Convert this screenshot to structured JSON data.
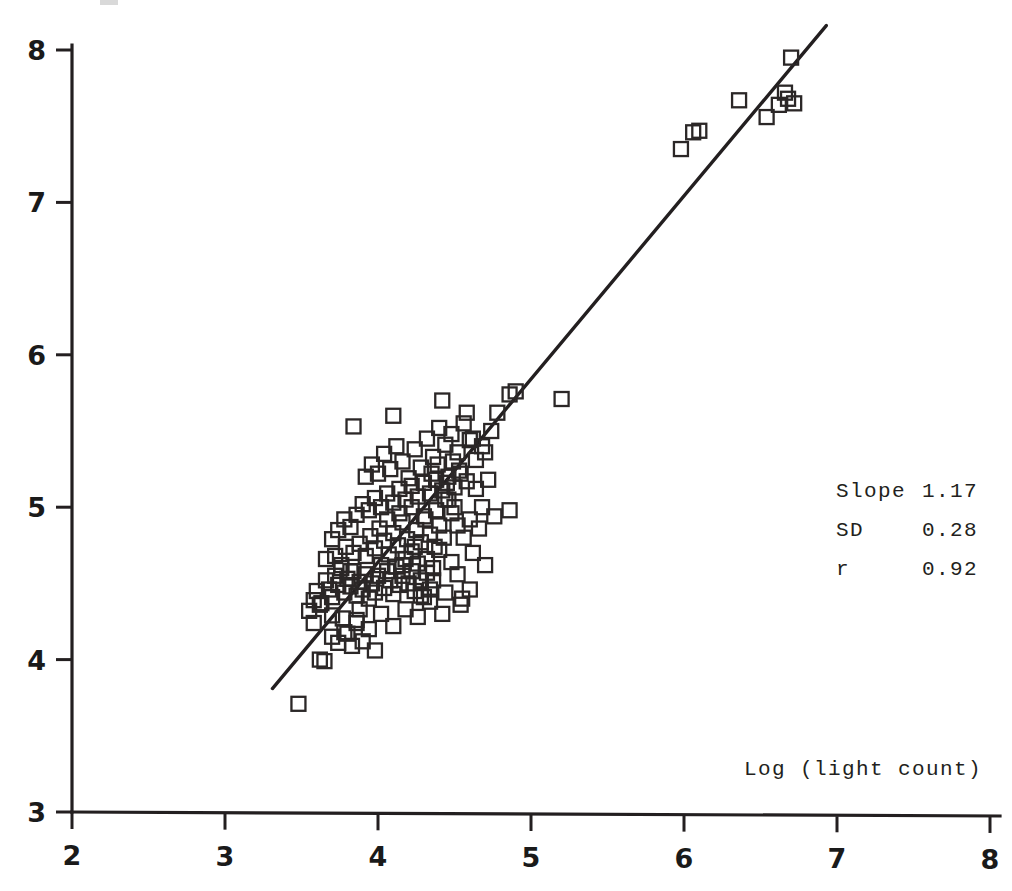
{
  "chart_data": {
    "type": "scatter",
    "title": "",
    "xlabel": "Log (light count)",
    "ylabel": "",
    "xlim": [
      2,
      8
    ],
    "ylim": [
      3,
      8
    ],
    "xticks": [
      2,
      3,
      4,
      5,
      6,
      7,
      8
    ],
    "yticks": [
      3,
      4,
      5,
      6,
      7,
      8
    ],
    "xtick_labels": [
      "2",
      "3",
      "4",
      "5",
      "6",
      "7",
      "8"
    ],
    "ytick_labels": [
      "3",
      "4",
      "5",
      "6",
      "7",
      "8"
    ],
    "grid": false,
    "legend": "none",
    "marker": "open-square",
    "marker_color": "#2b2727",
    "line_color": "#231f20",
    "fit_line": {
      "type": "linear-regression",
      "x_start": 3.31,
      "y_start": 3.81,
      "x_end": 6.93,
      "y_end": 8.16
    },
    "annotations": {
      "slope_label": "Slope",
      "slope_value": "1.17",
      "sd_label": "SD",
      "sd_value": "0.28",
      "r_label": "r",
      "r_value": "0.92"
    },
    "points": [
      [
        3.48,
        3.71
      ],
      [
        3.62,
        4.0
      ],
      [
        3.65,
        3.99
      ],
      [
        3.7,
        4.15
      ],
      [
        3.74,
        4.11
      ],
      [
        3.77,
        4.27
      ],
      [
        3.8,
        4.17
      ],
      [
        3.83,
        4.09
      ],
      [
        3.86,
        4.24
      ],
      [
        3.88,
        4.33
      ],
      [
        3.55,
        4.32
      ],
      [
        3.58,
        4.39
      ],
      [
        3.6,
        4.45
      ],
      [
        3.63,
        4.37
      ],
      [
        3.66,
        4.52
      ],
      [
        3.68,
        4.46
      ],
      [
        3.7,
        4.41
      ],
      [
        3.72,
        4.55
      ],
      [
        3.74,
        4.49
      ],
      [
        3.76,
        4.6
      ],
      [
        3.78,
        4.44
      ],
      [
        3.8,
        4.53
      ],
      [
        3.82,
        4.48
      ],
      [
        3.84,
        4.58
      ],
      [
        3.86,
        4.42
      ],
      [
        3.88,
        4.51
      ],
      [
        3.9,
        4.46
      ],
      [
        3.92,
        4.56
      ],
      [
        3.94,
        4.4
      ],
      [
        3.96,
        4.5
      ],
      [
        3.98,
        4.44
      ],
      [
        4.0,
        4.55
      ],
      [
        4.02,
        4.62
      ],
      [
        4.04,
        4.47
      ],
      [
        4.06,
        4.58
      ],
      [
        4.08,
        4.52
      ],
      [
        4.1,
        4.43
      ],
      [
        4.12,
        4.61
      ],
      [
        4.14,
        4.49
      ],
      [
        4.16,
        4.55
      ],
      [
        4.18,
        4.66
      ],
      [
        4.2,
        4.5
      ],
      [
        4.22,
        4.58
      ],
      [
        4.24,
        4.45
      ],
      [
        4.26,
        4.63
      ],
      [
        4.28,
        4.52
      ],
      [
        4.3,
        4.41
      ],
      [
        4.32,
        4.57
      ],
      [
        4.34,
        4.46
      ],
      [
        4.36,
        4.6
      ],
      [
        3.84,
        4.7
      ],
      [
        3.88,
        4.76
      ],
      [
        3.92,
        4.68
      ],
      [
        3.95,
        4.81
      ],
      [
        3.98,
        4.73
      ],
      [
        4.01,
        4.86
      ],
      [
        4.04,
        4.78
      ],
      [
        4.07,
        4.69
      ],
      [
        4.1,
        4.83
      ],
      [
        4.13,
        4.75
      ],
      [
        4.16,
        4.9
      ],
      [
        4.19,
        4.79
      ],
      [
        4.22,
        4.71
      ],
      [
        4.25,
        4.85
      ],
      [
        4.28,
        4.77
      ],
      [
        4.31,
        4.92
      ],
      [
        4.34,
        4.82
      ],
      [
        4.37,
        4.74
      ],
      [
        4.4,
        4.88
      ],
      [
        4.43,
        4.8
      ],
      [
        3.72,
        4.68
      ],
      [
        3.76,
        4.62
      ],
      [
        3.79,
        4.74
      ],
      [
        3.82,
        4.58
      ],
      [
        3.66,
        4.66
      ],
      [
        3.7,
        4.79
      ],
      [
        3.74,
        4.85
      ],
      [
        3.78,
        4.92
      ],
      [
        3.82,
        4.87
      ],
      [
        3.86,
        4.95
      ],
      [
        3.9,
        5.02
      ],
      [
        3.94,
        4.98
      ],
      [
        3.98,
        5.06
      ],
      [
        4.02,
        5.0
      ],
      [
        4.06,
        5.09
      ],
      [
        4.1,
        5.03
      ],
      [
        4.14,
        5.12
      ],
      [
        4.18,
        5.05
      ],
      [
        4.22,
        5.14
      ],
      [
        4.26,
        5.07
      ],
      [
        4.3,
        5.16
      ],
      [
        4.34,
        5.09
      ],
      [
        4.38,
        5.18
      ],
      [
        4.42,
        5.11
      ],
      [
        4.46,
        5.2
      ],
      [
        4.5,
        5.13
      ],
      [
        4.54,
        5.22
      ],
      [
        4.58,
        5.17
      ],
      [
        4.46,
        5.05
      ],
      [
        4.5,
        5.0
      ],
      [
        3.92,
        5.2
      ],
      [
        3.96,
        5.28
      ],
      [
        4.0,
        5.22
      ],
      [
        4.04,
        5.35
      ],
      [
        4.08,
        5.25
      ],
      [
        4.12,
        5.4
      ],
      [
        4.16,
        5.3
      ],
      [
        4.2,
        5.19
      ],
      [
        4.24,
        5.38
      ],
      [
        4.28,
        5.26
      ],
      [
        4.32,
        5.45
      ],
      [
        4.36,
        5.33
      ],
      [
        4.4,
        5.52
      ],
      [
        4.44,
        5.41
      ],
      [
        4.48,
        5.48
      ],
      [
        4.52,
        5.36
      ],
      [
        4.56,
        5.55
      ],
      [
        4.6,
        5.44
      ],
      [
        4.64,
        5.31
      ],
      [
        4.68,
        5.4
      ],
      [
        3.84,
        5.53
      ],
      [
        4.1,
        5.6
      ],
      [
        4.42,
        5.7
      ],
      [
        4.58,
        5.62
      ],
      [
        4.62,
        5.45
      ],
      [
        4.7,
        5.36
      ],
      [
        4.74,
        5.5
      ],
      [
        4.78,
        5.62
      ],
      [
        4.86,
        5.74
      ],
      [
        4.9,
        5.76
      ],
      [
        5.2,
        5.71
      ],
      [
        4.86,
        4.98
      ],
      [
        4.7,
        4.62
      ],
      [
        4.62,
        4.7
      ],
      [
        4.55,
        4.4
      ],
      [
        4.54,
        4.36
      ],
      [
        4.42,
        4.3
      ],
      [
        4.34,
        4.38
      ],
      [
        4.26,
        4.28
      ],
      [
        4.18,
        4.33
      ],
      [
        4.1,
        4.22
      ],
      [
        4.02,
        4.3
      ],
      [
        3.94,
        4.2
      ],
      [
        3.86,
        4.26
      ],
      [
        3.78,
        4.18
      ],
      [
        3.7,
        4.29
      ],
      [
        3.62,
        4.36
      ],
      [
        3.58,
        4.24
      ],
      [
        3.9,
        4.12
      ],
      [
        3.98,
        4.06
      ],
      [
        4.28,
        4.42
      ],
      [
        4.36,
        4.52
      ],
      [
        4.44,
        4.44
      ],
      [
        4.52,
        4.56
      ],
      [
        4.6,
        4.46
      ],
      [
        4.48,
        4.64
      ],
      [
        4.4,
        4.72
      ],
      [
        4.32,
        4.66
      ],
      [
        4.24,
        4.74
      ],
      [
        4.16,
        4.62
      ],
      [
        4.44,
        5.05
      ],
      [
        4.48,
        4.96
      ],
      [
        4.52,
        4.88
      ],
      [
        4.56,
        4.8
      ],
      [
        4.6,
        4.92
      ],
      [
        4.38,
        4.98
      ],
      [
        4.3,
        4.94
      ],
      [
        4.22,
        5.0
      ],
      [
        4.14,
        4.96
      ],
      [
        4.06,
        4.92
      ],
      [
        4.35,
        5.22
      ],
      [
        4.39,
        5.28
      ],
      [
        4.45,
        5.16
      ],
      [
        4.49,
        5.3
      ],
      [
        4.53,
        5.24
      ],
      [
        5.98,
        7.35
      ],
      [
        6.06,
        7.46
      ],
      [
        6.1,
        7.47
      ],
      [
        6.36,
        7.67
      ],
      [
        6.54,
        7.56
      ],
      [
        6.62,
        7.64
      ],
      [
        6.66,
        7.72
      ],
      [
        6.68,
        7.68
      ],
      [
        6.72,
        7.65
      ],
      [
        6.7,
        7.95
      ],
      [
        4.72,
        5.18
      ],
      [
        4.64,
        5.12
      ],
      [
        4.68,
        5.0
      ],
      [
        4.76,
        4.94
      ],
      [
        4.66,
        4.86
      ]
    ]
  },
  "axis_titles": {
    "x": "Log (light count)"
  }
}
